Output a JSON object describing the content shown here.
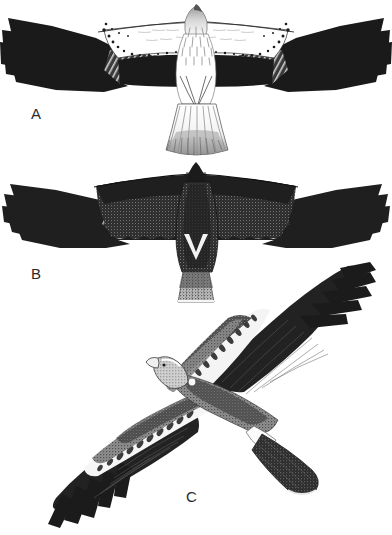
{
  "plate": {
    "title": "Raptor flight plumage plate",
    "description": "Three-figure black-and-white field-guide plate of a large raptor in flight",
    "background_color": "#ffffff",
    "ink_color": "#1a1a1a",
    "width": 392,
    "height": 535
  },
  "figures": [
    {
      "id": "A",
      "label": "A",
      "name": "pale-morph-underside",
      "description": "Pale morph seen from below, wings fully spread, tail fanned",
      "view": "underside",
      "posture": "soaring, wings horizontal",
      "plumage": "white body and underwing coverts, black primaries and black trailing edge band, dark spotting along leading edge of inner wing, lightly streaked breast, white fanned tail",
      "wingspan_px": 392,
      "top_px": 4,
      "bottom_px": 157
    },
    {
      "id": "B",
      "label": "B",
      "name": "dark-morph-underside",
      "description": "Dark morph seen from below, wings fully spread, tail closed",
      "view": "underside",
      "posture": "soaring, wings horizontal",
      "plumage": "uniformly blackish-brown stippled body and underwing, paler grey stippled flight feathers showing as streaks at wrist, small white V on lower breast, pale grey stippled tail",
      "wingspan_px": 378,
      "top_px": 162,
      "bottom_px": 300
    },
    {
      "id": "C",
      "label": "C",
      "name": "upperside-banking",
      "description": "Bird banking, seen from above at an angle, head to upper left",
      "view": "upperside",
      "posture": "banking, body axis diagonal from lower left to upper right",
      "plumage": "dark brown wings and flight feathers, broad whitish band across the greater coverts of both wings, pale grey crown and mantle, dark tail with pale base",
      "top_px": 265,
      "bottom_px": 535
    }
  ],
  "labels": {
    "a": "A",
    "b": "B",
    "c": "C"
  }
}
